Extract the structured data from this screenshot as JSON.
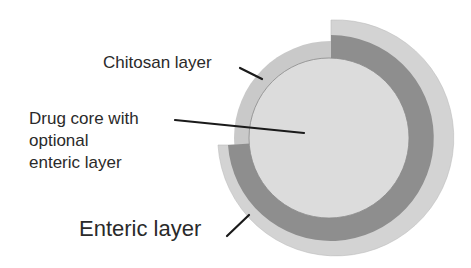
{
  "diagram": {
    "labels": {
      "chitosan": "Chitosan layer",
      "core": [
        "Drug core with",
        "optional",
        "enteric layer"
      ],
      "enteric": "Enteric layer"
    },
    "colors": {
      "core_fill": "#dcdcdc",
      "core_outline": "#8a8a8a",
      "chitosan_fill": "#c9c9c9",
      "enteric_band": "#8e8e8e",
      "outer_arc": "#d3d3d3",
      "leader": "#1a1a1a",
      "text": "#2a2a2a"
    }
  }
}
